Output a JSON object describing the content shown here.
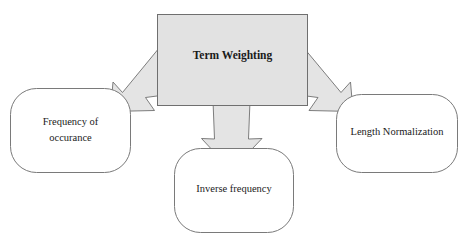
{
  "diagram": {
    "type": "flow-diagram",
    "title": "Term Weighting",
    "background_color": "#ffffff",
    "root": {
      "id": "term-weighting",
      "label": "Term Weighting",
      "shape": "rectangle",
      "fill_color": "#e2e2e2",
      "stroke_color": "#6f6f6f",
      "bold": true
    },
    "children": [
      {
        "id": "frequency-of-occurance",
        "label_line1": "Frequency of",
        "label_line2": "occurance",
        "shape": "rounded-rectangle",
        "fill_color": "#ffffff",
        "stroke_color": "#7a7a7a",
        "position": "left"
      },
      {
        "id": "inverse-frequency",
        "label_line1": "Inverse frequency",
        "label_line2": "",
        "shape": "rounded-rectangle",
        "fill_color": "#ffffff",
        "stroke_color": "#7a7a7a",
        "position": "bottom"
      },
      {
        "id": "length-normalization",
        "label_line1": "Length Normalization",
        "label_line2": "",
        "shape": "rounded-rectangle",
        "fill_color": "#ffffff",
        "stroke_color": "#7a7a7a",
        "position": "right"
      }
    ],
    "connectors": [
      {
        "id": "arrow-to-frequency",
        "from": "term-weighting",
        "to": "frequency-of-occurance",
        "style": "block-arrow",
        "direction": "down-left",
        "fill_color": "#e4e4e4",
        "stroke_color": "#6f6f6f"
      },
      {
        "id": "arrow-to-inverse-frequency",
        "from": "term-weighting",
        "to": "inverse-frequency",
        "style": "block-arrow",
        "direction": "down",
        "fill_color": "#e4e4e4",
        "stroke_color": "#6f6f6f"
      },
      {
        "id": "arrow-to-length-normalization",
        "from": "term-weighting",
        "to": "length-normalization",
        "style": "block-arrow",
        "direction": "down-right",
        "fill_color": "#e4e4e4",
        "stroke_color": "#6f6f6f"
      }
    ]
  }
}
